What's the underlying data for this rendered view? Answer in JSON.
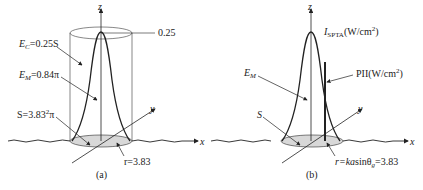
{
  "figure": {
    "panels": [
      {
        "id": "a",
        "caption": "(a)",
        "axes": {
          "z": "z",
          "y": "y",
          "x": "x"
        },
        "peak_label": "0.25",
        "annotations": {
          "ec": {
            "sym": "E",
            "sub": "C",
            "rest": "=0.25S"
          },
          "em": {
            "sym": "E",
            "sub": "M",
            "rest": "=0.84π"
          },
          "s": {
            "text": "S=3.83",
            "sup": "2",
            "tail": "π"
          },
          "r": {
            "text": "r=3.83"
          }
        }
      },
      {
        "id": "b",
        "caption": "(b)",
        "axes": {
          "z": "z",
          "y": "y",
          "x": "x"
        },
        "annotations": {
          "ispta": {
            "sym": "I",
            "sub": "SPTA",
            "rest": "(W/cm",
            "sup": "2",
            "tail": ")"
          },
          "pii": {
            "text": "PII(W/cm",
            "sup": "2",
            "tail": ")"
          },
          "em": {
            "sym": "E",
            "sub": "M"
          },
          "s": {
            "text": "S"
          },
          "r": {
            "pre": "r=ka",
            "mid": "sinθ",
            "sub": "g",
            "tail": "=3.83"
          }
        }
      }
    ]
  },
  "colors": {
    "line": "#222222",
    "disk": "#d8d8d8",
    "cyl": "#555555"
  }
}
